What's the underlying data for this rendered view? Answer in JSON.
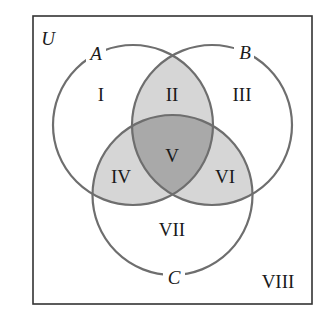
{
  "diagram": {
    "type": "venn",
    "universe_label": "U",
    "sets": [
      {
        "id": "A",
        "label": "A"
      },
      {
        "id": "B",
        "label": "B"
      },
      {
        "id": "C",
        "label": "C"
      }
    ],
    "regions": [
      {
        "id": "I",
        "label": "I",
        "shading": "none"
      },
      {
        "id": "II",
        "label": "II",
        "shading": "light"
      },
      {
        "id": "III",
        "label": "III",
        "shading": "none"
      },
      {
        "id": "IV",
        "label": "IV",
        "shading": "light"
      },
      {
        "id": "V",
        "label": "V",
        "shading": "dark"
      },
      {
        "id": "VI",
        "label": "VI",
        "shading": "light"
      },
      {
        "id": "VII",
        "label": "VII",
        "shading": "none"
      },
      {
        "id": "VIII",
        "label": "VIII",
        "shading": "none"
      }
    ],
    "colors": {
      "background": "#ffffff",
      "frame": "#333333",
      "circle_stroke": "#6e6e6e",
      "light_shade": "#d6d6d6",
      "dark_shade": "#a9a9a9",
      "text": "#1a1a1a"
    }
  }
}
